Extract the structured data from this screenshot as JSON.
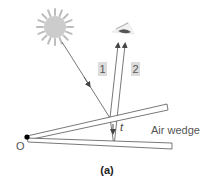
{
  "figure": {
    "caption": "(a)",
    "vertex_label": "O",
    "thickness_label": "t",
    "wedge_label": "Air wedge",
    "ray_labels": [
      "1",
      "2"
    ],
    "elements": {
      "light_source": "sun-icon",
      "observer": "eye-icon"
    },
    "colors": {
      "line": "#555555",
      "plate_fill": "#ffffff",
      "sun": "#c8c8c8",
      "label_box": "#dcdcdc",
      "vertex_dot": "#000000"
    }
  }
}
